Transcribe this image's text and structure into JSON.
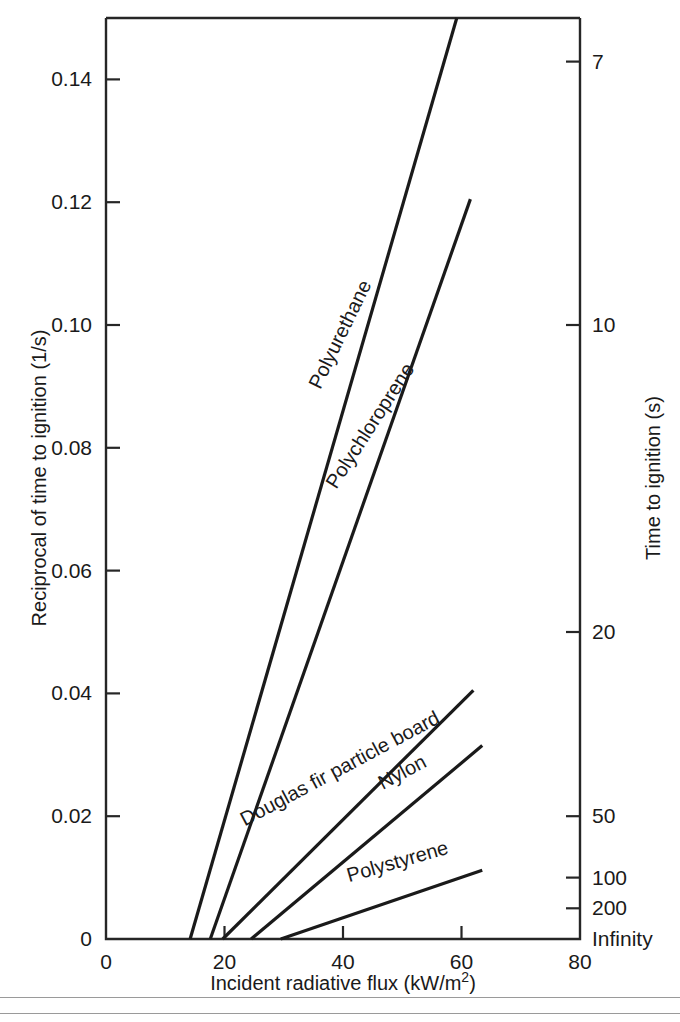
{
  "chart_data": {
    "type": "line",
    "title": "",
    "xlabel": "Incident radiative flux (kW/m",
    "xlabel_sup": "2",
    "xlabel_tail": ")",
    "ylabel": "Reciprocal of time to ignition (1/s)",
    "ylabel_right": "Time to ignition (s)",
    "xlim": [
      0,
      80
    ],
    "ylim": [
      0,
      0.15
    ],
    "grid": false,
    "legend": "inline-curve-labels",
    "xticks": [
      0,
      20,
      40,
      60,
      80
    ],
    "xticklabels": [
      "0",
      "20",
      "40",
      "60",
      "80"
    ],
    "yticks": [
      0,
      0.02,
      0.04,
      0.06,
      0.08,
      0.1,
      0.12,
      0.14
    ],
    "yticklabels": [
      "0",
      "0.02",
      "0.04",
      "0.06",
      "0.08",
      "0.10",
      "0.12",
      "0.14"
    ],
    "right_axis": {
      "label": "Time to ignition (s)",
      "ticks_seconds": [
        7,
        10,
        20,
        50,
        100,
        200,
        "Infinity"
      ],
      "tick_values_reciprocal": [
        0.1429,
        0.1,
        0.05,
        0.02,
        0.01,
        0.005,
        0
      ],
      "ticklabels": [
        "7",
        "10",
        "20",
        "50",
        "100",
        "200",
        "Infinity"
      ]
    },
    "series": [
      {
        "name": "Polyurethane",
        "color": "#1a1a1a",
        "x": [
          14.2,
          59.2
        ],
        "y": [
          0.0,
          0.15
        ],
        "label_x": 40.5,
        "label_y": 0.098,
        "label_angle": -64
      },
      {
        "name": "Polychloroprene",
        "color": "#1a1a1a",
        "x": [
          17.6,
          61.5
        ],
        "y": [
          0.0,
          0.1205
        ],
        "label_x": 45.5,
        "label_y": 0.083,
        "label_angle": -57
      },
      {
        "name": "Douglas fir particle board",
        "color": "#1a1a1a",
        "x": [
          19.7,
          62.0
        ],
        "y": [
          0.0,
          0.0405
        ],
        "label_x": 40.0,
        "label_y": 0.0268,
        "label_angle": -28
      },
      {
        "name": "Nylon",
        "color": "#1a1a1a",
        "x": [
          24.5,
          63.5
        ],
        "y": [
          0.0,
          0.0315
        ],
        "label_x": 50.5,
        "label_y": 0.0262,
        "label_angle": -28
      },
      {
        "name": "Polystyrene",
        "color": "#1a1a1a",
        "x": [
          29.5,
          63.5
        ],
        "y": [
          0.0,
          0.0112
        ],
        "label_x": 49.5,
        "label_y": 0.0116,
        "label_angle": -16
      }
    ]
  }
}
